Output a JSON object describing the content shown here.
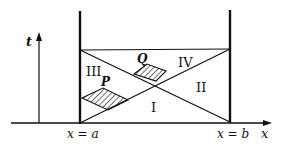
{
  "diagram": {
    "axes": {
      "t_label": "t",
      "x_label": "x"
    },
    "boundaries": {
      "left_label": "x = a",
      "right_label": "x = b"
    },
    "regions": {
      "I": "I",
      "II": "II",
      "III": "III",
      "IV": "IV"
    },
    "hatched_regions": {
      "P": "P",
      "Q": "Q"
    },
    "colors": {
      "ink": "#111111",
      "background": "#ffffff"
    }
  }
}
